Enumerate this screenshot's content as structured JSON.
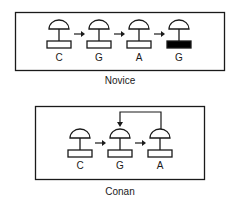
{
  "panels": [
    {
      "caption": "Novice",
      "stamps": [
        {
          "letter": "C",
          "filled": false
        },
        {
          "letter": "G",
          "filled": false
        },
        {
          "letter": "A",
          "filled": false
        },
        {
          "letter": "G",
          "filled": true
        }
      ],
      "feedback": null
    },
    {
      "caption": "Conan",
      "stamps": [
        {
          "letter": "C",
          "filled": false
        },
        {
          "letter": "G",
          "filled": false
        },
        {
          "letter": "A",
          "filled": false
        }
      ],
      "feedback": {
        "from": 2,
        "to": 1
      }
    }
  ],
  "colors": {
    "stroke": "#1a1a1a",
    "fill": "#000000",
    "background": "#ffffff"
  }
}
